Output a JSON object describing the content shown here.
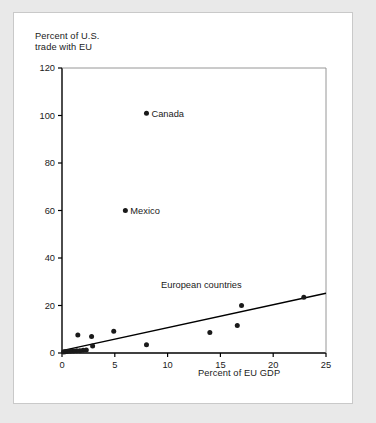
{
  "chart_data": {
    "type": "scatter",
    "title": "",
    "xlabel": "Percent of EU GDP",
    "ylabel": "Percent of U.S.\ntrade with EU",
    "ylabel_line1": "Percent of U.S.",
    "ylabel_line2": "trade with EU",
    "xlim": [
      0,
      25
    ],
    "ylim": [
      0,
      120
    ],
    "xticks": [
      0,
      5,
      10,
      15,
      20,
      25
    ],
    "yticks": [
      0,
      20,
      40,
      60,
      80,
      100,
      120
    ],
    "xtick_labels": [
      "0",
      "5",
      "10",
      "15",
      "20",
      "25"
    ],
    "ytick_labels": [
      "0",
      "20",
      "40",
      "60",
      "80",
      "100",
      "120"
    ],
    "grid": false,
    "legend": "none",
    "marker_color": "#1a1a1a",
    "line_color": "#000000",
    "axis_color": "#000000",
    "background": "#ffffff",
    "page_background": "#e9e9e9",
    "points": [
      {
        "x": 8.0,
        "y": 101.0,
        "label": "Canada"
      },
      {
        "x": 6.0,
        "y": 60.0,
        "label": "Mexico"
      },
      {
        "x": 22.9,
        "y": 23.5,
        "label": ""
      },
      {
        "x": 17.0,
        "y": 20.0,
        "label": ""
      },
      {
        "x": 16.6,
        "y": 11.6,
        "label": ""
      },
      {
        "x": 14.0,
        "y": 8.6,
        "label": ""
      },
      {
        "x": 4.9,
        "y": 9.2,
        "label": ""
      },
      {
        "x": 8.0,
        "y": 3.5,
        "label": ""
      },
      {
        "x": 2.8,
        "y": 7.0,
        "label": ""
      },
      {
        "x": 1.5,
        "y": 7.6,
        "label": ""
      },
      {
        "x": 2.9,
        "y": 3.0,
        "label": ""
      },
      {
        "x": 2.3,
        "y": 1.3,
        "label": ""
      },
      {
        "x": 2.0,
        "y": 1.2,
        "label": ""
      },
      {
        "x": 1.7,
        "y": 1.0,
        "label": ""
      },
      {
        "x": 1.4,
        "y": 0.9,
        "label": ""
      },
      {
        "x": 1.1,
        "y": 0.8,
        "label": ""
      },
      {
        "x": 0.8,
        "y": 0.7,
        "label": ""
      },
      {
        "x": 0.5,
        "y": 0.6,
        "label": ""
      },
      {
        "x": 0.3,
        "y": 0.5,
        "label": ""
      },
      {
        "x": 0.15,
        "y": 0.4,
        "label": ""
      }
    ],
    "trend_line": {
      "x0": 0.0,
      "y0": 1.0,
      "x1": 25.0,
      "y1": 25.2
    },
    "annotations": [
      {
        "text": "Canada",
        "x": 8.0,
        "y": 101.0
      },
      {
        "text": "Mexico",
        "x": 6.0,
        "y": 60.0
      },
      {
        "text": "European countries",
        "x": 13.2,
        "y": 27.5
      }
    ],
    "group_label": "European countries"
  }
}
